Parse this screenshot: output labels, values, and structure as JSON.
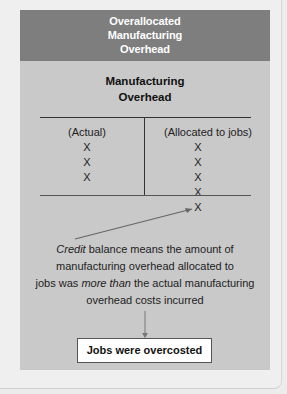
{
  "header": {
    "lines": [
      "Overallocated",
      "Manufacturing",
      "Overhead"
    ]
  },
  "t_account": {
    "title_lines": [
      "Manufacturing",
      "Overhead"
    ],
    "debit_header": "(Actual)",
    "credit_header": "(Allocated to jobs)",
    "debit_entries": [
      "X",
      "X",
      "X"
    ],
    "credit_entries": [
      "X",
      "X",
      "X",
      "X"
    ],
    "credit_balance": "X"
  },
  "explanation": {
    "part1_italic": "Credit",
    "part1": " balance means the amount of",
    "line2": "manufacturing overhead allocated to",
    "line3_pre": "jobs was ",
    "line3_italic": "more than",
    "line3_post": " the actual manufacturing",
    "line4": "overhead costs incurred"
  },
  "result": {
    "label": "Jobs were overcosted"
  },
  "colors": {
    "header_bg": "#7e7e7e",
    "panel_bg": "#c9c9c9",
    "page_bg": "#ececec",
    "result_bg": "#ffffff"
  }
}
